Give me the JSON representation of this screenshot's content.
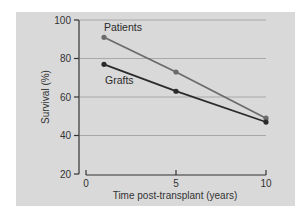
{
  "chart_data": {
    "type": "line",
    "title": "",
    "xlabel": "Time post-transplant (years)",
    "ylabel": "Survival (%)",
    "xlim": [
      0,
      10
    ],
    "ylim": [
      20,
      100
    ],
    "x_ticks": [
      "0",
      "5",
      "10"
    ],
    "y_ticks": [
      "100",
      "80",
      "60",
      "40",
      "20"
    ],
    "grid": {
      "horizontal": true,
      "values": [
        100,
        80,
        60,
        40
      ]
    },
    "legend": "inline labels",
    "x": [
      1,
      5,
      10
    ],
    "series": [
      {
        "name": "Patients",
        "values": [
          91,
          73,
          49
        ],
        "color": "#6b6b6b"
      },
      {
        "name": "Grafts",
        "values": [
          77,
          63,
          47
        ],
        "color": "#2b2b2b"
      }
    ]
  },
  "colors": {
    "panel_background": "#d9d9d9",
    "gridline": "#a8a8a8",
    "axis": "#333333"
  }
}
